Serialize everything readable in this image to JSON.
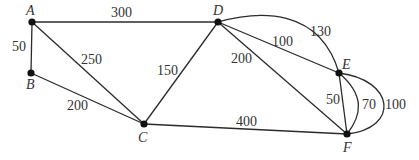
{
  "graph": {
    "type": "weighted-undirected-multigraph",
    "colors": {
      "edge": "#2b2b2b",
      "node": "#111111",
      "text": "#333333",
      "background": "#ffffff"
    },
    "nodes": {
      "A": {
        "label": "A",
        "x": 32,
        "y": 22
      },
      "B": {
        "label": "B",
        "x": 31,
        "y": 73
      },
      "C": {
        "label": "C",
        "x": 144,
        "y": 124
      },
      "D": {
        "label": "D",
        "x": 218,
        "y": 22
      },
      "E": {
        "label": "E",
        "x": 339,
        "y": 73
      },
      "F": {
        "label": "F",
        "x": 347,
        "y": 134
      }
    },
    "edges": {
      "AD": {
        "from": "A",
        "to": "D",
        "weight": "300",
        "shape": "straight"
      },
      "AB": {
        "from": "A",
        "to": "B",
        "weight": "50",
        "shape": "straight"
      },
      "AC": {
        "from": "A",
        "to": "C",
        "weight": "250",
        "shape": "straight"
      },
      "BC": {
        "from": "B",
        "to": "C",
        "weight": "200",
        "shape": "straight"
      },
      "CD": {
        "from": "C",
        "to": "D",
        "weight": "150",
        "shape": "straight"
      },
      "CF": {
        "from": "C",
        "to": "F",
        "weight": "400",
        "shape": "straight"
      },
      "DE_straight": {
        "from": "D",
        "to": "E",
        "weight": "100",
        "shape": "straight"
      },
      "DE_arc": {
        "from": "D",
        "to": "E",
        "weight": "130",
        "shape": "arc"
      },
      "DF": {
        "from": "D",
        "to": "F",
        "weight": "200",
        "shape": "straight"
      },
      "EF_straight": {
        "from": "E",
        "to": "F",
        "weight": "50",
        "shape": "straight"
      },
      "EF_inner": {
        "from": "E",
        "to": "F",
        "weight": "70",
        "shape": "curve"
      },
      "EF_outer": {
        "from": "E",
        "to": "F",
        "weight": "100",
        "shape": "loop-curve"
      }
    }
  }
}
